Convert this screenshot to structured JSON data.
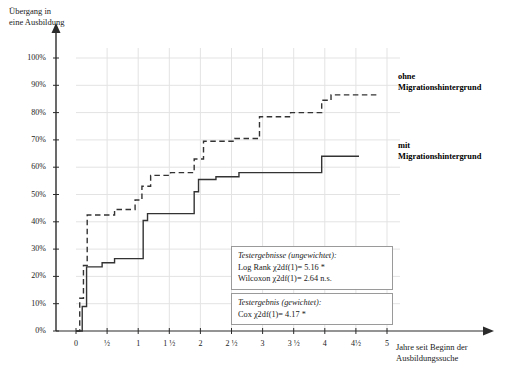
{
  "chart_data": {
    "type": "line",
    "title": "",
    "ylabel": "Übergang in\neine Ausbildung",
    "xlabel": "Jahre seit Beginn der\nAusbildungssuche",
    "xlim": [
      -0.25,
      5.35
    ],
    "ylim": [
      0,
      100
    ],
    "grid": true,
    "y_ticks": [
      "0%",
      "10%",
      "20%",
      "30%",
      "40%",
      "50%",
      "60%",
      "70%",
      "80%",
      "90%",
      "100%"
    ],
    "y_tick_values": [
      0,
      10,
      20,
      30,
      40,
      50,
      60,
      70,
      80,
      90,
      100
    ],
    "x_ticks": [
      "0",
      "½",
      "1",
      "1 ½",
      "2",
      "2 ½",
      "3",
      "3 ½",
      "4",
      "4½",
      "5"
    ],
    "x_tick_values": [
      0,
      0.5,
      1,
      1.5,
      2,
      2.5,
      3,
      3.5,
      4,
      4.5,
      5
    ],
    "legend_position": "right-inline",
    "series": [
      {
        "name": "ohne Migrationshintergrund",
        "style": "dashed",
        "color": "#333333",
        "label_text": "ohne\nMigrationshintergrund",
        "points": [
          [
            0.0,
            0.0
          ],
          [
            0.06,
            0.0
          ],
          [
            0.06,
            12.0
          ],
          [
            0.12,
            12.0
          ],
          [
            0.12,
            24.0
          ],
          [
            0.18,
            24.0
          ],
          [
            0.18,
            42.5
          ],
          [
            0.62,
            42.5
          ],
          [
            0.62,
            44.5
          ],
          [
            0.95,
            44.5
          ],
          [
            0.95,
            48.0
          ],
          [
            1.06,
            48.0
          ],
          [
            1.06,
            53.0
          ],
          [
            1.2,
            53.0
          ],
          [
            1.2,
            57.0
          ],
          [
            1.52,
            57.0
          ],
          [
            1.52,
            58.0
          ],
          [
            1.9,
            58.0
          ],
          [
            1.9,
            63.0
          ],
          [
            2.05,
            63.0
          ],
          [
            2.05,
            69.5
          ],
          [
            2.55,
            69.5
          ],
          [
            2.55,
            70.5
          ],
          [
            2.95,
            70.5
          ],
          [
            2.95,
            78.5
          ],
          [
            3.45,
            78.5
          ],
          [
            3.45,
            80.0
          ],
          [
            3.95,
            80.0
          ],
          [
            3.95,
            84.5
          ],
          [
            4.1,
            84.5
          ],
          [
            4.1,
            86.5
          ],
          [
            4.85,
            86.5
          ]
        ]
      },
      {
        "name": "mit Migrationshintergrund",
        "style": "solid",
        "color": "#333333",
        "label_text": "mit\nMigrationshintergrund",
        "points": [
          [
            0.0,
            0.0
          ],
          [
            0.1,
            0.0
          ],
          [
            0.1,
            9.0
          ],
          [
            0.17,
            9.0
          ],
          [
            0.17,
            23.5
          ],
          [
            0.42,
            23.5
          ],
          [
            0.42,
            25.0
          ],
          [
            0.62,
            25.0
          ],
          [
            0.62,
            26.5
          ],
          [
            1.08,
            26.5
          ],
          [
            1.08,
            40.5
          ],
          [
            1.15,
            40.5
          ],
          [
            1.15,
            43.0
          ],
          [
            1.9,
            43.0
          ],
          [
            1.9,
            51.0
          ],
          [
            1.97,
            51.0
          ],
          [
            1.97,
            55.5
          ],
          [
            2.25,
            55.5
          ],
          [
            2.25,
            56.5
          ],
          [
            2.62,
            56.5
          ],
          [
            2.62,
            58.0
          ],
          [
            3.95,
            58.0
          ],
          [
            3.95,
            64.0
          ],
          [
            4.55,
            64.0
          ]
        ]
      }
    ],
    "annotations": [
      {
        "id": "testergebnisse-ungewichtet",
        "header": "Testergebnisse (ungewichtet):",
        "lines": [
          "Log Rank χ2df(1)= 5.16 *",
          "Wilcoxon χ2df(1)= 2.64 n.s."
        ]
      },
      {
        "id": "testergebnis-gewichtet",
        "header": "Testergebnis (gewichtet):",
        "lines": [
          "Cox χ2df(1)= 4.17 *"
        ]
      }
    ]
  }
}
